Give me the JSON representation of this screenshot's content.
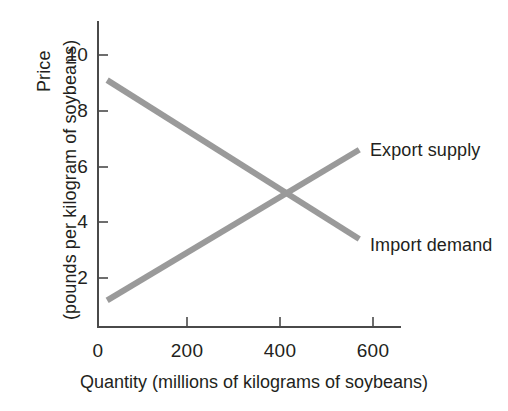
{
  "chart_data": {
    "type": "line",
    "title": "",
    "xlabel": "Quantity (millions of kilograms of soybeans)",
    "ylabel_line1": "Price",
    "ylabel_line2": "(pounds per kilogram of soybeans)",
    "xlim": [
      0,
      645
    ],
    "ylim": [
      0,
      11
    ],
    "xticks": [
      0,
      200,
      400,
      600
    ],
    "xtick_labels": [
      "0",
      "200",
      "400",
      "600"
    ],
    "yticks": [
      2,
      4,
      6,
      8,
      10
    ],
    "ytick_labels": [
      "2",
      "4",
      "6",
      "8",
      "10"
    ],
    "grid": false,
    "legend_position": "inline-right",
    "line_color": "#9a9a9a",
    "axis_color": "#4a4a4a",
    "series": [
      {
        "name": "Import demand",
        "label": "Import demand",
        "x": [
          20,
          570
        ],
        "values": [
          9.1,
          3.4
        ],
        "color": "#9a9a9a",
        "slope_direction": "downward"
      },
      {
        "name": "Export supply",
        "label": "Export supply",
        "x": [
          20,
          570
        ],
        "values": [
          1.2,
          6.6
        ],
        "color": "#9a9a9a",
        "slope_direction": "upward"
      }
    ],
    "annotations": [
      {
        "name": "equilibrium",
        "x": 410,
        "y": 5.0,
        "text": ""
      }
    ]
  }
}
